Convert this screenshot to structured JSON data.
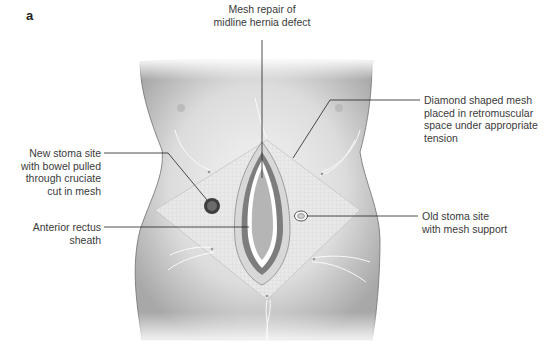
{
  "panel_label": "a",
  "labels": {
    "mesh_repair": [
      "Mesh repair of",
      "midline hernia defect"
    ],
    "diamond_mesh": [
      "Diamond shaped mesh",
      "placed in retromuscular",
      "space under appropriate",
      "tension"
    ],
    "new_stoma": [
      "New stoma site",
      "with bowel pulled",
      "through cruciate",
      "cut in mesh"
    ],
    "anterior_rectus": [
      "Anterior rectus",
      "sheath"
    ],
    "old_stoma": [
      "Old stoma site",
      "with mesh support"
    ]
  },
  "colors": {
    "skin_light": "#f2f2f2",
    "skin_mid": "#d6d6d6",
    "skin_dark": "#a9a9a9",
    "outline": "#6e6e6e",
    "mesh": "#e6e6e6",
    "sheath_dark": "#7a7a7a",
    "sheath_white": "#ffffff",
    "defect": "#b5b5b5",
    "stoma_dark": "#444444",
    "leader": "#222222"
  }
}
